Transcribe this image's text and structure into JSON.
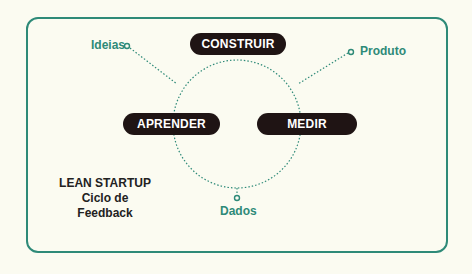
{
  "colors": {
    "background": "#fbfbf1",
    "accent": "#2e8a78",
    "pill": "#1f1414",
    "pill_text": "#ffffff",
    "title_text": "#222222"
  },
  "diagram": {
    "title": "LEAN STARTUP",
    "subtitle": "Ciclo de Feedback",
    "stages": [
      {
        "label": "CONSTRUIR"
      },
      {
        "label": "MEDIR"
      },
      {
        "label": "APRENDER"
      }
    ],
    "outputs": [
      {
        "label": "Produto"
      },
      {
        "label": "Dados"
      },
      {
        "label": "Ideias"
      }
    ]
  }
}
